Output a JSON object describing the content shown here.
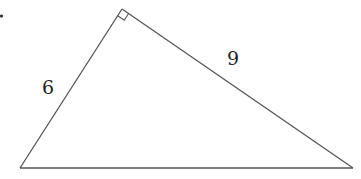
{
  "figure": {
    "type": "right-triangle",
    "line_color": "#555555",
    "label_color": "#222222",
    "vertices": {
      "right_angle": [
        122,
        9
      ],
      "bottom_left": [
        20,
        168
      ],
      "bottom_right": [
        353,
        168
      ]
    },
    "right_angle_marker": true,
    "sides": [
      {
        "name": "left-leg",
        "label": "6"
      },
      {
        "name": "right-leg",
        "label": "9"
      },
      {
        "name": "hypotenuse",
        "label": ""
      }
    ],
    "bullet": "."
  }
}
